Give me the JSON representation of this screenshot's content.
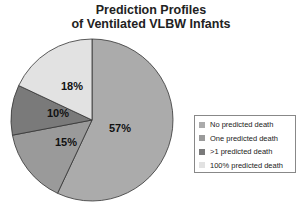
{
  "chart_data": {
    "type": "pie",
    "title": "Prediction Profiles of Ventilated VLBW Infants",
    "title_lines": [
      "Prediction Profiles",
      "of Ventilated VLBW Infants"
    ],
    "categories": [
      "No predicted death",
      "One predicted death",
      ">1 predicted death",
      "100% predicted death"
    ],
    "values": [
      57,
      15,
      10,
      18
    ],
    "labels": [
      "57%",
      "15%",
      "10%",
      "18%"
    ],
    "colors": [
      "#ababab",
      "#9a9a9a",
      "#7a7a7a",
      "#e2e2e2"
    ],
    "legend_position": "right"
  }
}
